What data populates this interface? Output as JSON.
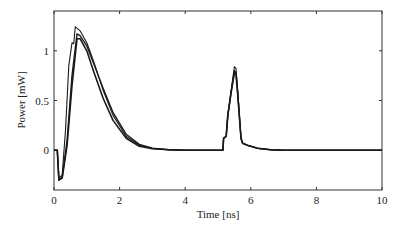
{
  "chart_data": {
    "type": "line",
    "title": "",
    "xlabel": "Time [ns]",
    "ylabel": "Power [mW]",
    "xlim": [
      0,
      10
    ],
    "ylim": [
      -0.4,
      1.4
    ],
    "xticks": [
      0,
      2,
      4,
      6,
      8,
      10
    ],
    "yticks": [
      0,
      0.5,
      1
    ],
    "xtick_labels": [
      "0",
      "2",
      "4",
      "6",
      "8",
      "10"
    ],
    "ytick_labels": [
      "0",
      "0.5",
      "1"
    ],
    "grid": false,
    "legend": null,
    "series": [
      {
        "name": "trace-1",
        "x": [
          0,
          0.1,
          0.15,
          0.25,
          0.35,
          0.45,
          0.55,
          0.6,
          0.65,
          0.8,
          1.0,
          1.2,
          1.5,
          1.8,
          2.2,
          2.6,
          3.0,
          3.5,
          4.0,
          5.15,
          5.17,
          5.25,
          5.3,
          5.4,
          5.5,
          5.55,
          5.6,
          5.7,
          5.75,
          5.9,
          6.2,
          6.6,
          7.0,
          8.0,
          10.0
        ],
        "y": [
          0,
          0,
          -0.28,
          -0.25,
          0.2,
          0.85,
          1.08,
          1.07,
          1.24,
          1.2,
          1.08,
          0.9,
          0.6,
          0.35,
          0.14,
          0.05,
          0.02,
          0.005,
          0,
          0,
          0.12,
          0.14,
          0.35,
          0.6,
          0.84,
          0.82,
          0.6,
          0.12,
          0.07,
          0.05,
          0.02,
          0.005,
          0,
          0,
          0
        ]
      },
      {
        "name": "trace-2",
        "x": [
          0,
          0.1,
          0.15,
          0.25,
          0.4,
          0.55,
          0.7,
          0.8,
          1.0,
          1.2,
          1.5,
          1.8,
          2.2,
          2.6,
          3.0,
          3.5,
          4.0,
          5.15,
          5.17,
          5.25,
          5.3,
          5.4,
          5.5,
          5.55,
          5.6,
          5.7,
          5.75,
          5.9,
          6.2,
          6.6,
          7.0,
          8.0,
          10.0
        ],
        "y": [
          0,
          0,
          -0.3,
          -0.27,
          0.1,
          0.75,
          1.17,
          1.15,
          1.05,
          0.88,
          0.62,
          0.38,
          0.16,
          0.06,
          0.02,
          0.005,
          0,
          0,
          0.12,
          0.14,
          0.35,
          0.58,
          0.8,
          0.78,
          0.58,
          0.12,
          0.07,
          0.05,
          0.02,
          0.005,
          0,
          0,
          0
        ]
      },
      {
        "name": "trace-3",
        "x": [
          0,
          0.1,
          0.15,
          0.25,
          0.4,
          0.55,
          0.7,
          0.8,
          1.0,
          1.2,
          1.5,
          1.8,
          2.2,
          2.6,
          3.0,
          3.5,
          4.0,
          5.15,
          5.17,
          5.25,
          5.3,
          5.4,
          5.5,
          5.55,
          5.6,
          5.7,
          5.75,
          5.9,
          6.2,
          6.6,
          7.0,
          8.0,
          10.0
        ],
        "y": [
          0,
          0,
          -0.3,
          -0.28,
          0.05,
          0.65,
          1.12,
          1.12,
          1.0,
          0.8,
          0.52,
          0.3,
          0.12,
          0.04,
          0.015,
          0.004,
          0,
          0,
          0.12,
          0.14,
          0.35,
          0.58,
          0.78,
          0.76,
          0.56,
          0.12,
          0.07,
          0.05,
          0.02,
          0.005,
          0,
          0,
          0
        ]
      }
    ]
  },
  "axes": {
    "xlabel": "Time [ns]",
    "ylabel": "Power [mW]"
  }
}
